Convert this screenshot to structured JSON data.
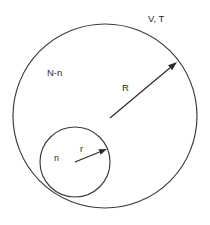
{
  "figure": {
    "background_color": "#ffffff",
    "stroke_color": "#3a3a3a",
    "text_color": "#2b2b2b",
    "width": 210,
    "height": 225
  },
  "labels": {
    "system_state": "V, T",
    "outer_population": "N-n",
    "outer_radius": "R",
    "inner_population": "n",
    "inner_radius": "r"
  },
  "shapes": {
    "outer_circle": {
      "name": "outer-sphere",
      "cx": 105,
      "cy": 116,
      "r": 92
    },
    "inner_circle": {
      "name": "inner-sphere",
      "cx": 75,
      "cy": 162,
      "r": 35
    }
  },
  "arrows": {
    "outer_radius_arrow": {
      "x1": 110,
      "y1": 118,
      "x2": 177,
      "y2": 62
    },
    "inner_radius_arrow": {
      "x1": 75,
      "y1": 162,
      "x2": 107,
      "y2": 149
    }
  },
  "label_positions": {
    "system_state": {
      "x": 148,
      "y": 19
    },
    "outer_population": {
      "x": 47,
      "y": 73
    },
    "outer_radius": {
      "x": 122,
      "y": 88
    },
    "inner_population": {
      "x": 54,
      "y": 159
    },
    "inner_radius": {
      "x": 80,
      "y": 150
    }
  }
}
